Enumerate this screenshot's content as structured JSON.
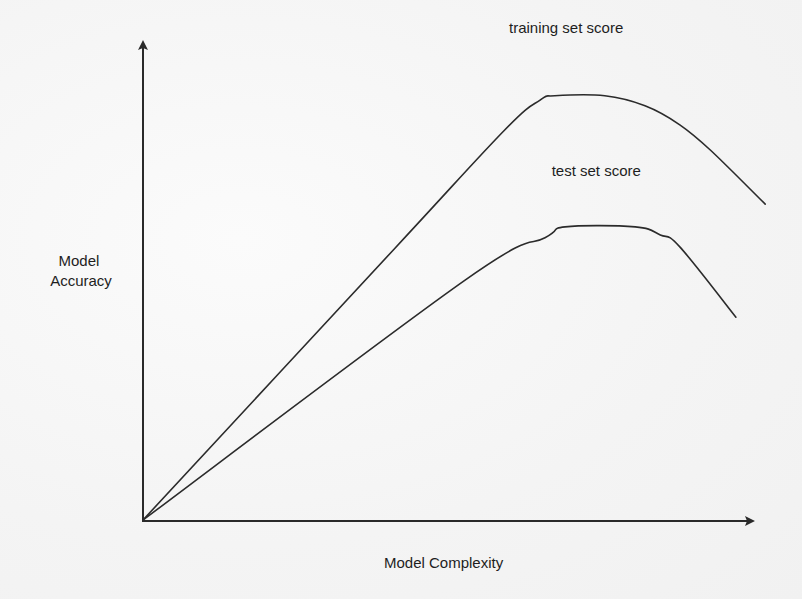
{
  "chart_data": {
    "type": "line",
    "title": "",
    "xlabel": "Model Complexity",
    "ylabel_lines": [
      "Model",
      "Accuracy"
    ],
    "xlim": [
      0,
      10
    ],
    "ylim": [
      0,
      10
    ],
    "grid": false,
    "ticks": false,
    "axis_arrows": true,
    "line_color": "#2b2b2b",
    "axis_color": "#2a2a2a",
    "series": [
      {
        "name": "training set score",
        "x": [
          0,
          4.1,
          5.93,
          6.51,
          6.75,
          7.57,
          8.23,
          8.8,
          9.3,
          10.2
        ],
        "y": [
          0,
          5.68,
          8.21,
          8.84,
          8.93,
          8.93,
          8.72,
          8.32,
          7.79,
          6.65
        ]
      },
      {
        "name": "test set score",
        "x": [
          0,
          5.28,
          6.59,
          6.92,
          8.07,
          8.48,
          8.8,
          9.72
        ],
        "y": [
          0,
          5.05,
          5.94,
          6.17,
          6.17,
          6.0,
          5.75,
          4.27
        ]
      }
    ],
    "annotations": [
      {
        "text": "training set score",
        "series": "training set score",
        "x": 6.0,
        "y": 10.25
      },
      {
        "text": "test set score",
        "series": "test set score",
        "x": 6.7,
        "y": 7.25
      }
    ]
  }
}
